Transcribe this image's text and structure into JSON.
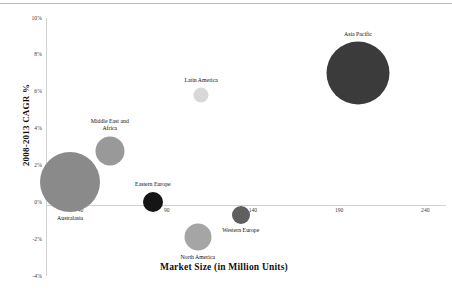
{
  "chart_data": {
    "type": "scatter",
    "title": "",
    "xlabel": "Market Size (in Million Units)",
    "ylabel": "2008-2013 CAGR %",
    "xlim": [
      20,
      252
    ],
    "ylim": [
      -4,
      10
    ],
    "xticks": [
      "40",
      "90",
      "140",
      "190",
      "240"
    ],
    "yticks": [
      "10%",
      "8%",
      "6%",
      "4%",
      "2%",
      "0%",
      "-2%",
      "-4%"
    ],
    "grid": false,
    "legend": "none",
    "series": [
      {
        "name": "Australasia",
        "x": 34,
        "y": 1.1,
        "size": 60,
        "color": "#8a8a8a",
        "label": "Australasia",
        "label_pos": "below"
      },
      {
        "name": "Middle East and Africa",
        "x": 57,
        "y": 2.8,
        "size": 29,
        "color": "#999999",
        "label": "Middle East and\nAfrica",
        "label_pos": "above"
      },
      {
        "name": "Latin America",
        "x": 110,
        "y": 5.8,
        "size": 15,
        "color": "#d8d8d8",
        "label": "Latin America",
        "label_pos": "above"
      },
      {
        "name": "Eastern Europe",
        "x": 82,
        "y": 0.0,
        "size": 20,
        "color": "#151515",
        "label": "Eastern Europe",
        "label_pos": "above"
      },
      {
        "name": "North America",
        "x": 108,
        "y": -1.9,
        "size": 27,
        "color": "#a5a5a5",
        "label": "North America",
        "label_pos": "below"
      },
      {
        "name": "Western Europe",
        "x": 133,
        "y": -0.7,
        "size": 18,
        "color": "#5f5f5f",
        "label": "Western Europe",
        "label_pos": "below"
      },
      {
        "name": "Asia Pacific",
        "x": 201,
        "y": 7.0,
        "size": 63,
        "color": "#3b3b3b",
        "label": "Asia Pacific",
        "label_pos": "above"
      }
    ]
  }
}
